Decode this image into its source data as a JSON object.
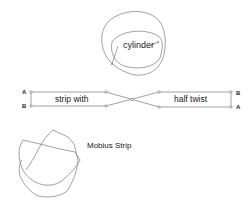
{
  "diagram": {
    "cylinder": {
      "label": "cylinder"
    },
    "strip": {
      "left_label": "strip with",
      "right_label": "half twist",
      "left_top_corner": "A",
      "left_bottom_corner": "B",
      "right_top_corner": "B",
      "right_bottom_corner": "A"
    },
    "mobius": {
      "label": "Mobius Strip"
    },
    "colors": {
      "line": "#8a8a8a",
      "text": "#222222"
    }
  }
}
